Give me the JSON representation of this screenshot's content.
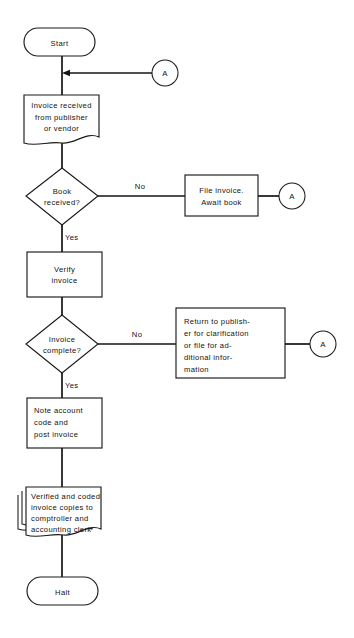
{
  "diagram": {
    "background_color": "#ffffff",
    "line_color": "#151515",
    "text_color": "#111111"
  },
  "nodes": {
    "start": {
      "label": "Start",
      "shape": "terminator"
    },
    "invoice_received": {
      "shape": "document",
      "lines": [
        "Invoice received",
        "from publisher",
        "or vendor"
      ]
    },
    "book_received": {
      "shape": "decision",
      "lines": [
        "Book",
        "received?"
      ]
    },
    "file_invoice": {
      "shape": "process",
      "lines": [
        "File invoice.",
        "Await book"
      ]
    },
    "verify_invoice": {
      "shape": "process",
      "lines": [
        "Verify",
        "invoice"
      ]
    },
    "invoice_complete": {
      "shape": "decision",
      "lines": [
        "Invoice",
        "complete?"
      ]
    },
    "return_to_publisher": {
      "shape": "process",
      "lines": [
        "Return to publish-",
        "er for clarification",
        "or file for ad-",
        "ditional infor-",
        "mation"
      ]
    },
    "note_account": {
      "shape": "process",
      "lines": [
        "Note account",
        "code and",
        "post invoice"
      ]
    },
    "verified_copies": {
      "shape": "multidocument",
      "lines": [
        "Verified and coded",
        "invoice copies to",
        "comptroller and",
        "accounting clerk"
      ]
    },
    "halt": {
      "label": "Halt",
      "shape": "terminator"
    }
  },
  "connectors": {
    "a_top": "A",
    "a_book": "A",
    "a_complete": "A"
  },
  "edge_labels": {
    "book_no": "No",
    "book_yes": "Yes",
    "complete_no": "No",
    "complete_yes": "Yes"
  }
}
